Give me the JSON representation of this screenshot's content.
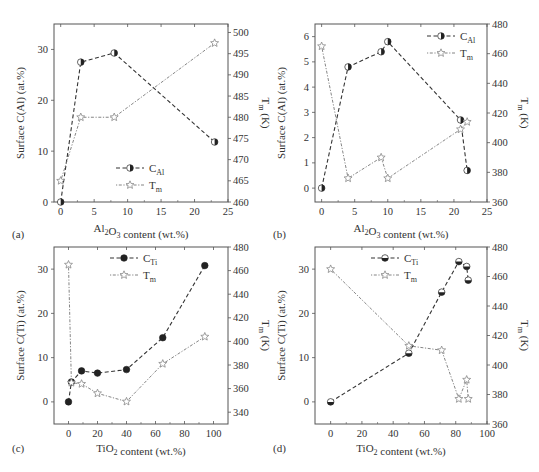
{
  "chart_data": [
    {
      "panel": "(a)",
      "type": "line",
      "xlabel": "Al2O3 content (wt.%)",
      "xlabel_parts": {
        "pre": "Al",
        "sub1": "2",
        "mid": "O",
        "sub2": "3",
        "post": " content (wt.%)"
      },
      "ylabel": "Surface C(Al) (at.%)",
      "y2label": "Tm (K)",
      "xlim": [
        -1,
        25
      ],
      "xticks": [
        0,
        5,
        10,
        15,
        20,
        25
      ],
      "ylim": [
        0,
        35
      ],
      "yticks": [
        0,
        10,
        20,
        30
      ],
      "y2lim": [
        460,
        502
      ],
      "y2ticks": [
        460,
        465,
        470,
        475,
        480,
        485,
        490,
        495,
        500
      ],
      "legend": {
        "position": "lower-center",
        "entries": [
          "C_Al",
          "T_m"
        ]
      },
      "series": [
        {
          "name": "C_Al",
          "axis": "left",
          "style": "dashed",
          "marker": "half-filled-circle",
          "x": [
            0,
            3,
            8,
            23
          ],
          "y": [
            0,
            27.5,
            29.3,
            11.8
          ]
        },
        {
          "name": "T_m",
          "axis": "right",
          "style": "dotted",
          "marker": "star-open",
          "x": [
            0,
            3,
            8,
            23
          ],
          "y": [
            465,
            480,
            480,
            497.5
          ]
        }
      ]
    },
    {
      "panel": "(b)",
      "type": "line",
      "xlabel": "Al2O3 content (wt.%)",
      "xlabel_parts": {
        "pre": "Al",
        "sub1": "2",
        "mid": "O",
        "sub2": "3",
        "post": " content (wt.%)"
      },
      "ylabel": "Surface C(Al) (at.%)",
      "y2label": "Tm (K)",
      "xlim": [
        -1,
        25
      ],
      "xticks": [
        0,
        5,
        10,
        15,
        20,
        25
      ],
      "ylim": [
        -0.55,
        6.5
      ],
      "yticks": [
        0,
        1,
        2,
        3,
        4,
        5,
        6
      ],
      "y2lim": [
        360,
        480
      ],
      "y2ticks": [
        360,
        380,
        400,
        420,
        440,
        460,
        480
      ],
      "legend": {
        "position": "upper-right",
        "entries": [
          "C_Al",
          "T_m"
        ]
      },
      "series": [
        {
          "name": "C_Al",
          "axis": "left",
          "style": "dashed",
          "marker": "half-filled-circle",
          "x": [
            0,
            4,
            9,
            10,
            21,
            22
          ],
          "y": [
            0,
            4.8,
            5.4,
            5.8,
            2.7,
            0.7
          ]
        },
        {
          "name": "T_m",
          "axis": "right",
          "style": "dotted",
          "marker": "star-open",
          "x": [
            0,
            4,
            9,
            10,
            21,
            22
          ],
          "y": [
            465,
            376,
            390,
            376,
            409,
            414
          ]
        }
      ]
    },
    {
      "panel": "(c)",
      "type": "line",
      "xlabel": "TiO2 content (wt.%)",
      "xlabel_parts": {
        "pre": "TiO",
        "sub1": "2",
        "mid": "",
        "sub2": "",
        "post": " content (wt.%)"
      },
      "ylabel": "Surface C(Ti) (at.%)",
      "y2label": "Tm (K)",
      "xlim": [
        -10,
        110
      ],
      "xticks": [
        0,
        20,
        40,
        60,
        80,
        100
      ],
      "ylim": [
        -5,
        35
      ],
      "yticks": [
        0,
        10,
        20,
        30
      ],
      "y2lim": [
        330,
        480
      ],
      "y2ticks": [
        340,
        360,
        380,
        400,
        420,
        440,
        460,
        480
      ],
      "legend": {
        "position": "upper-center",
        "entries": [
          "C_Ti",
          "T_m"
        ]
      },
      "series": [
        {
          "name": "C_Ti",
          "axis": "left",
          "style": "dashed",
          "marker": "filled-circle",
          "x": [
            0,
            2,
            9,
            20,
            40,
            65,
            94
          ],
          "y": [
            0,
            4.5,
            7.0,
            6.5,
            7.3,
            14.5,
            30.8
          ]
        },
        {
          "name": "T_m",
          "axis": "right",
          "style": "dotted",
          "marker": "star-open",
          "x": [
            0,
            2,
            9,
            20,
            40,
            65,
            94
          ],
          "y": [
            465,
            365,
            364,
            356,
            349,
            381,
            404
          ]
        }
      ]
    },
    {
      "panel": "(d)",
      "type": "line",
      "xlabel": "TiO2 content (wt.%)",
      "xlabel_parts": {
        "pre": "TiO",
        "sub1": "2",
        "mid": "",
        "sub2": "",
        "post": " content (wt.%)"
      },
      "ylabel": "Surface C(Ti) (at.%)",
      "y2label": "Tm (K)",
      "xlim": [
        -10,
        100
      ],
      "xticks": [
        0,
        20,
        40,
        60,
        80,
        100
      ],
      "ylim": [
        -5,
        35
      ],
      "yticks": [
        0,
        10,
        20,
        30
      ],
      "y2lim": [
        360,
        480
      ],
      "y2ticks": [
        360,
        380,
        400,
        420,
        440,
        460,
        480
      ],
      "legend": {
        "position": "upper-center",
        "entries": [
          "C_Ti",
          "T_m"
        ]
      },
      "series": [
        {
          "name": "C_Ti",
          "axis": "left",
          "style": "dashed",
          "marker": "half-filled-circle-bottom",
          "x": [
            0,
            50,
            71,
            82,
            87,
            88
          ],
          "y": [
            0,
            11,
            24.8,
            31.7,
            30.6,
            27.5
          ]
        },
        {
          "name": "T_m",
          "axis": "right",
          "style": "dotted",
          "marker": "star-open",
          "x": [
            0,
            50,
            71,
            82,
            87,
            88
          ],
          "y": [
            465,
            413,
            410,
            377,
            390,
            377
          ]
        }
      ]
    }
  ],
  "figure": {
    "panels": [
      {
        "label": "(a)",
        "legend": [
          {
            "main": "C",
            "sub": "Al"
          },
          {
            "main": "T",
            "sub": "m"
          }
        ],
        "ylabel": "Surface C(Al) (at.%)",
        "y2_main": "T",
        "y2_sub": "m",
        "y2_post": " (K)"
      },
      {
        "label": "(b)",
        "legend": [
          {
            "main": "C",
            "sub": "Al"
          },
          {
            "main": "T",
            "sub": "m"
          }
        ],
        "ylabel": "Surface C(Al) (at.%)",
        "y2_main": "T",
        "y2_sub": "m",
        "y2_post": " (K)"
      },
      {
        "label": "(c)",
        "legend": [
          {
            "main": "C",
            "sub": "Ti"
          },
          {
            "main": "T",
            "sub": "m"
          }
        ],
        "ylabel": "Surface C(Ti) (at.%)",
        "y2_main": "T",
        "y2_sub": "m",
        "y2_post": " (K)"
      },
      {
        "label": "(d)",
        "legend": [
          {
            "main": "C",
            "sub": "Ti"
          },
          {
            "main": "T",
            "sub": "m"
          }
        ],
        "ylabel": "Surface C(Ti) (at.%)",
        "y2_main": "T",
        "y2_sub": "m",
        "y2_post": " (K)"
      }
    ],
    "colors": {
      "axis": "#555555",
      "line": "#333333",
      "marker_fill": "#222222",
      "star": "#888888"
    }
  }
}
